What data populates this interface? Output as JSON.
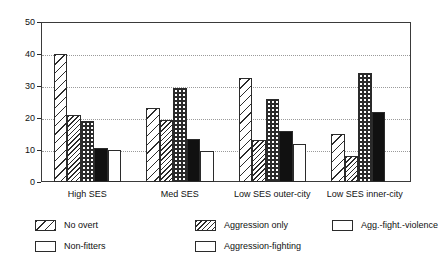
{
  "chart_data": {
    "type": "bar",
    "title": "",
    "subtitle": "",
    "xlabel": "",
    "ylabel": "",
    "ylim": [
      0,
      50
    ],
    "yticks": [
      0,
      10,
      20,
      30,
      40,
      50
    ],
    "ytick_labels": [
      "0",
      "10",
      "20",
      "30",
      "40",
      "50"
    ],
    "grid": true,
    "grid_axis": "y",
    "grid_style": "dotted",
    "legend_position": "below-plot",
    "categories": [
      "High SES",
      "Med SES",
      "Low SES outer-city",
      "Low SES inner-city"
    ],
    "series": [
      {
        "name": "No overt",
        "pattern": "sparse-diagonal-hatch",
        "values": [
          40.0,
          23.0,
          32.5,
          15.0
        ]
      },
      {
        "name": "Aggression only",
        "pattern": "dense-diagonal-hatch",
        "values": [
          21.0,
          19.5,
          13.0,
          8.0
        ]
      },
      {
        "name": "Aggression-fighting",
        "pattern": "dark-dotted",
        "values": [
          19.0,
          29.5,
          26.0,
          34.0
        ]
      },
      {
        "name": "Agg.-fight.-violence",
        "pattern": "solid-black",
        "values": [
          10.5,
          13.5,
          16.0,
          22.0
        ]
      },
      {
        "name": "Non-fitters",
        "pattern": "plain-white",
        "values": [
          10.0,
          9.7,
          12.0,
          0.0
        ]
      }
    ]
  },
  "legend": {
    "items": [
      {
        "label": "No overt"
      },
      {
        "label": "Aggression only"
      },
      {
        "label": "Agg.-fight.-violence"
      },
      {
        "label": "Non-fitters"
      },
      {
        "label": "Aggression-fighting"
      }
    ]
  },
  "colors": {
    "axis": "#2b2b2b",
    "grid": "#9a9a9a",
    "bar_outline": "#2b2b2b",
    "solid_black": "#111111",
    "background": "#ffffff"
  }
}
